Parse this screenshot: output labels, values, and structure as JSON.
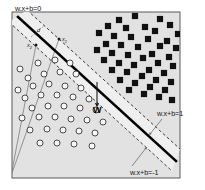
{
  "figure": {
    "kind": "diagram",
    "canvas": {
      "width": 205,
      "height": 190,
      "background": "#ffffff"
    },
    "plot_area": {
      "x": 12,
      "y": 12,
      "width": 168,
      "height": 166,
      "fill": "#e2e2e2",
      "border_color": "#4a4a4a",
      "margin_band_fill": "#efefef"
    },
    "colors": {
      "boundary": "#000000",
      "dashed": "#2b2b2b",
      "positive_class": "#111111",
      "negative_class_stroke": "#3a3a3a",
      "negative_class_fill": "#f7f7f7",
      "support_line": "#6f6f6f",
      "leader_line": "#5a5a5a",
      "text": "#161616"
    },
    "labels": {
      "hyperplane": "w.x+b=0",
      "margin_positive": "w.x+b=1",
      "margin_negative": "w.x+b=-1",
      "normal_vector": "W",
      "distance": "d",
      "support_point_1": "x",
      "support_point_1_sub": "1",
      "support_point_2": "x",
      "support_point_2_sub": "2"
    },
    "lines": {
      "boundary": {
        "x1": 18,
        "y1": 17,
        "x2": 176,
        "y2": 161,
        "stroke_width": 2.6
      },
      "margin_positive": {
        "x1": 9,
        "y1": 22,
        "x2": 172,
        "y2": 171,
        "stroke_width": 0.9,
        "dash": "3,2.4"
      },
      "margin_negative": {
        "x1": 27,
        "y1": 10,
        "x2": 180,
        "y2": 149,
        "stroke_width": 0.9,
        "dash": "3,2.4"
      },
      "normal_arrow": {
        "x1": 97,
        "y1": 82,
        "x2": 97,
        "y2": 105,
        "stroke_width": 1.1
      },
      "support_ray_1": {
        "x1": 11,
        "y1": 176,
        "x2": 59,
        "y2": 39
      },
      "support_ray_2": {
        "x1": 11,
        "y1": 176,
        "x2": 36,
        "y2": 45
      },
      "leader_positive": {
        "x1": 162,
        "y1": 119,
        "x2": 150,
        "y2": 134
      },
      "leader_negative": {
        "x1": 132,
        "y1": 166,
        "x2": 146,
        "y2": 148
      }
    },
    "label_positions": {
      "hyperplane": {
        "x": 15,
        "y": 11
      },
      "margin_positive": {
        "x": 157,
        "y": 116
      },
      "margin_negative": {
        "x": 130,
        "y": 175
      },
      "normal_vector": {
        "x": 93,
        "y": 113
      },
      "distance": {
        "x": 37,
        "y": 32
      },
      "support_point_1": {
        "x": 62,
        "y": 41
      },
      "support_point_2": {
        "x": 27,
        "y": 47
      }
    },
    "classes": [
      {
        "name": "positive",
        "marker": "filled-square",
        "count": 45,
        "region": "upper-right"
      },
      {
        "name": "negative",
        "marker": "open-circle",
        "count": 38,
        "region": "lower-left"
      }
    ],
    "squares": [
      [
        119,
        20
      ],
      [
        135,
        16
      ],
      [
        160,
        19
      ],
      [
        170,
        25
      ],
      [
        178,
        34
      ],
      [
        108,
        26
      ],
      [
        126,
        28
      ],
      [
        145,
        27
      ],
      [
        155,
        31
      ],
      [
        167,
        41
      ],
      [
        99,
        33
      ],
      [
        114,
        36
      ],
      [
        131,
        37
      ],
      [
        148,
        39
      ],
      [
        160,
        46
      ],
      [
        176,
        48
      ],
      [
        106,
        44
      ],
      [
        121,
        45
      ],
      [
        138,
        47
      ],
      [
        152,
        54
      ],
      [
        169,
        57
      ],
      [
        97,
        50
      ],
      [
        112,
        53
      ],
      [
        128,
        55
      ],
      [
        143,
        58
      ],
      [
        158,
        63
      ],
      [
        173,
        66
      ],
      [
        104,
        60
      ],
      [
        119,
        63
      ],
      [
        134,
        65
      ],
      [
        149,
        70
      ],
      [
        164,
        73
      ],
      [
        112,
        70
      ],
      [
        127,
        72
      ],
      [
        142,
        76
      ],
      [
        156,
        80
      ],
      [
        171,
        82
      ],
      [
        120,
        80
      ],
      [
        135,
        83
      ],
      [
        150,
        87
      ],
      [
        165,
        90
      ],
      [
        129,
        90
      ],
      [
        144,
        94
      ],
      [
        159,
        97
      ],
      [
        172,
        100
      ]
    ],
    "circles": [
      [
        20,
        69
      ],
      [
        38,
        63
      ],
      [
        55,
        60
      ],
      [
        70,
        63
      ],
      [
        28,
        78
      ],
      [
        44,
        74
      ],
      [
        60,
        72
      ],
      [
        76,
        74
      ],
      [
        18,
        90
      ],
      [
        33,
        86
      ],
      [
        49,
        84
      ],
      [
        65,
        86
      ],
      [
        81,
        88
      ],
      [
        25,
        98
      ],
      [
        41,
        95
      ],
      [
        57,
        95
      ],
      [
        73,
        97
      ],
      [
        89,
        99
      ],
      [
        32,
        108
      ],
      [
        48,
        106
      ],
      [
        64,
        106
      ],
      [
        80,
        108
      ],
      [
        96,
        110
      ],
      [
        22,
        118
      ],
      [
        39,
        117
      ],
      [
        55,
        117
      ],
      [
        71,
        119
      ],
      [
        87,
        120
      ],
      [
        103,
        122
      ],
      [
        30,
        130
      ],
      [
        47,
        129
      ],
      [
        63,
        130
      ],
      [
        79,
        131
      ],
      [
        95,
        133
      ],
      [
        40,
        143
      ],
      [
        57,
        143
      ],
      [
        74,
        144
      ],
      [
        92,
        146
      ]
    ]
  }
}
